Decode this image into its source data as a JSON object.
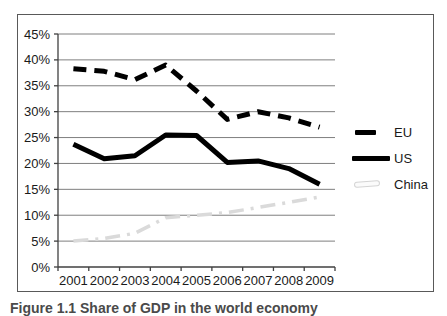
{
  "figure": {
    "caption": "Figure 1.1 Share of GDP in the world economy"
  },
  "chart_data": {
    "type": "line",
    "title": "",
    "xlabel": "",
    "ylabel": "",
    "categories": [
      "2001",
      "2002",
      "2003",
      "2004",
      "2005",
      "2006",
      "2007",
      "2008",
      "2009"
    ],
    "series": [
      {
        "name": "EU",
        "values": [
          38.3,
          37.8,
          36.2,
          39.0,
          34.0,
          28.5,
          30.0,
          28.8,
          27.0
        ],
        "style": {
          "color": "#000000",
          "width": 5,
          "dash": "13 8"
        }
      },
      {
        "name": "US",
        "values": [
          23.7,
          20.9,
          21.5,
          25.5,
          25.4,
          20.2,
          20.5,
          19.0,
          16.0
        ],
        "style": {
          "color": "#000000",
          "width": 5,
          "dash": ""
        }
      },
      {
        "name": "China",
        "values": [
          5.0,
          5.5,
          6.5,
          9.5,
          10.0,
          10.5,
          11.5,
          12.5,
          13.5
        ],
        "style": {
          "color": "#dadada",
          "width": 3.5,
          "dash": "15 7 3 7"
        }
      }
    ],
    "ylim": [
      0,
      45
    ],
    "ytick_step": 5,
    "ytick_labels": [
      "0%",
      "5%",
      "10%",
      "15%",
      "20%",
      "25%",
      "30%",
      "35%",
      "40%",
      "45%"
    ],
    "grid": "horizontal",
    "legend_position": "right",
    "axis_color": "#404040",
    "grid_color": "#7f7f7f",
    "label_color": "#1a1a1a",
    "label_font_size": 13
  }
}
